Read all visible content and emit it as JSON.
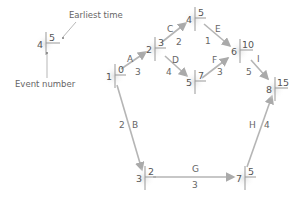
{
  "legend": {
    "earliest_time_label": "Earliest time",
    "event_number_label": "Event number",
    "example_event": "4",
    "example_time": "5"
  },
  "nodes": [
    {
      "id": "1",
      "earliest": "0"
    },
    {
      "id": "2",
      "earliest": "3"
    },
    {
      "id": "3",
      "earliest": "2"
    },
    {
      "id": "4",
      "earliest": "5"
    },
    {
      "id": "5",
      "earliest": "7"
    },
    {
      "id": "6",
      "earliest": "10"
    },
    {
      "id": "7",
      "earliest": "5"
    },
    {
      "id": "8",
      "earliest": "15"
    }
  ],
  "activities": [
    {
      "name": "A",
      "duration": "3",
      "from": "1",
      "to": "2"
    },
    {
      "name": "B",
      "duration": "2",
      "from": "1",
      "to": "3"
    },
    {
      "name": "C",
      "duration": "2",
      "from": "2",
      "to": "4"
    },
    {
      "name": "D",
      "duration": "4",
      "from": "2",
      "to": "5"
    },
    {
      "name": "E",
      "duration": "1",
      "from": "4",
      "to": "6"
    },
    {
      "name": "F",
      "duration": "3",
      "from": "5",
      "to": "6"
    },
    {
      "name": "G",
      "duration": "3",
      "from": "3",
      "to": "7"
    },
    {
      "name": "H",
      "duration": "4",
      "from": "7",
      "to": "8"
    },
    {
      "name": "I",
      "duration": "5",
      "from": "6",
      "to": "8"
    }
  ],
  "colors": {
    "arrow": "#b5b5b5",
    "node_shade": "#e6e6e6",
    "text": "#555555"
  }
}
